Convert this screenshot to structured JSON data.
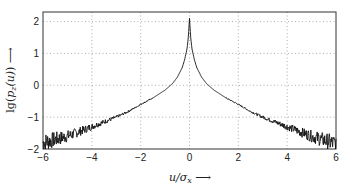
{
  "chart_data": {
    "type": "line",
    "title": "",
    "xlabel": "u/σ_x →",
    "ylabel": "lg(p_z(u)) →",
    "xlim": [
      -6,
      6
    ],
    "ylim": [
      -2,
      2.3
    ],
    "xticks": [
      -6,
      -4,
      -2,
      0,
      2,
      4,
      6
    ],
    "yticks": [
      -2,
      -1,
      0,
      1,
      2
    ],
    "grid": true,
    "grid_style": "dotted",
    "legend": null,
    "series": [
      {
        "name": "lg(p_z(u))",
        "color": "#111111",
        "noisy_tails": true,
        "x": [
          -6,
          -5.5,
          -5,
          -4.5,
          -4,
          -3.5,
          -3,
          -2.5,
          -2,
          -1.5,
          -1,
          -0.7,
          -0.5,
          -0.3,
          -0.2,
          -0.1,
          -0.05,
          0,
          0.05,
          0.1,
          0.2,
          0.3,
          0.5,
          0.7,
          1,
          1.5,
          2,
          2.5,
          3,
          3.5,
          4,
          4.5,
          5,
          5.5,
          6
        ],
        "y": [
          -1.8,
          -1.7,
          -1.6,
          -1.45,
          -1.3,
          -1.15,
          -1.0,
          -0.82,
          -0.6,
          -0.4,
          -0.15,
          0.05,
          0.25,
          0.55,
          0.8,
          1.15,
          1.5,
          2.1,
          1.5,
          1.15,
          0.8,
          0.55,
          0.25,
          0.05,
          -0.15,
          -0.4,
          -0.6,
          -0.82,
          -1.0,
          -1.15,
          -1.3,
          -1.45,
          -1.6,
          -1.72,
          -1.85
        ]
      }
    ]
  },
  "axes": {
    "x_tick_labels": [
      "−6",
      "−4",
      "−2",
      "0",
      "2",
      "4",
      "6"
    ],
    "y_tick_labels": [
      "−2",
      "−1",
      "0",
      "1",
      "2"
    ],
    "x_label": "u/σx ⟶",
    "y_label": "lg(pz(u)) ⟶"
  }
}
